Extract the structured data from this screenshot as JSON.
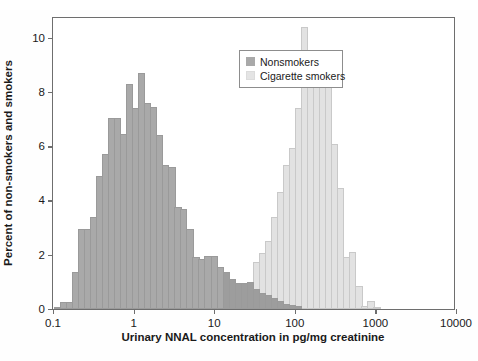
{
  "chart_data": {
    "type": "bar",
    "title": "",
    "subtitle": "",
    "xlabel": "Urinary NNAL concentration in pg/mg creatinine",
    "ylabel": "Percent of non-smokers and smokers",
    "xscale": "log",
    "xlim": [
      0.1,
      10000
    ],
    "ylim": [
      0,
      10.8
    ],
    "xticks": [
      0.1,
      1,
      10,
      100,
      1000,
      10000
    ],
    "xtick_labels": [
      "0.1",
      "1",
      "10",
      "100",
      "1000",
      "10000"
    ],
    "yticks": [
      0,
      2,
      4,
      6,
      8,
      10
    ],
    "ytick_labels": [
      "0",
      "2",
      "4",
      "6",
      "8",
      "10"
    ],
    "grid": false,
    "legend_position": "top-center",
    "bins_per_decade": 11,
    "series": [
      {
        "name": "Nonsmokers",
        "color": "#a9a9a9",
        "bins": [
          {
            "x": 0.115,
            "value": 0.05
          },
          {
            "x": 0.135,
            "value": 0.25
          },
          {
            "x": 0.16,
            "value": 0.25
          },
          {
            "x": 0.19,
            "value": 1.35
          },
          {
            "x": 0.225,
            "value": 2.95
          },
          {
            "x": 0.27,
            "value": 2.95
          },
          {
            "x": 0.32,
            "value": 3.4
          },
          {
            "x": 0.38,
            "value": 4.9
          },
          {
            "x": 0.45,
            "value": 5.7
          },
          {
            "x": 0.53,
            "value": 7.05
          },
          {
            "x": 0.63,
            "value": 7.05
          },
          {
            "x": 0.75,
            "value": 6.45
          },
          {
            "x": 0.89,
            "value": 8.3
          },
          {
            "x": 1.06,
            "value": 7.4
          },
          {
            "x": 1.26,
            "value": 8.7
          },
          {
            "x": 1.5,
            "value": 7.6
          },
          {
            "x": 1.78,
            "value": 7.45
          },
          {
            "x": 2.1,
            "value": 6.4
          },
          {
            "x": 2.5,
            "value": 5.3
          },
          {
            "x": 3.0,
            "value": 5.25
          },
          {
            "x": 3.55,
            "value": 3.75
          },
          {
            "x": 4.2,
            "value": 3.7
          },
          {
            "x": 5.0,
            "value": 2.95
          },
          {
            "x": 5.95,
            "value": 1.9
          },
          {
            "x": 7.05,
            "value": 1.85
          },
          {
            "x": 8.4,
            "value": 1.95
          },
          {
            "x": 10.0,
            "value": 1.95
          },
          {
            "x": 11.9,
            "value": 1.55
          },
          {
            "x": 14.1,
            "value": 1.35
          },
          {
            "x": 16.8,
            "value": 1.1
          },
          {
            "x": 19.9,
            "value": 0.95
          },
          {
            "x": 23.7,
            "value": 0.95
          },
          {
            "x": 28.1,
            "value": 1.0
          },
          {
            "x": 33.4,
            "value": 0.75
          },
          {
            "x": 39.7,
            "value": 0.6
          },
          {
            "x": 47.2,
            "value": 0.5
          },
          {
            "x": 56.0,
            "value": 0.4
          },
          {
            "x": 66.5,
            "value": 0.3
          },
          {
            "x": 79.0,
            "value": 0.2
          },
          {
            "x": 94.0,
            "value": 0.15
          },
          {
            "x": 111.5,
            "value": 0.1
          }
        ]
      },
      {
        "name": "Cigarette smokers",
        "color": "#e2e2e2",
        "bins": [
          {
            "x": 14.1,
            "value": 0.06
          },
          {
            "x": 16.8,
            "value": 0.06
          },
          {
            "x": 19.9,
            "value": 0.1
          },
          {
            "x": 23.7,
            "value": 0.95
          },
          {
            "x": 28.1,
            "value": 1.0
          },
          {
            "x": 33.4,
            "value": 1.75
          },
          {
            "x": 39.7,
            "value": 2.05
          },
          {
            "x": 47.2,
            "value": 2.5
          },
          {
            "x": 56.0,
            "value": 3.4
          },
          {
            "x": 66.5,
            "value": 4.3
          },
          {
            "x": 79.0,
            "value": 5.3
          },
          {
            "x": 94.0,
            "value": 5.95
          },
          {
            "x": 111.5,
            "value": 7.4
          },
          {
            "x": 132.5,
            "value": 10.4
          },
          {
            "x": 157.5,
            "value": 8.8
          },
          {
            "x": 187.0,
            "value": 9.1
          },
          {
            "x": 222.0,
            "value": 8.4
          },
          {
            "x": 264.0,
            "value": 8.55
          },
          {
            "x": 313.0,
            "value": 6.1
          },
          {
            "x": 372.0,
            "value": 4.45
          },
          {
            "x": 442.0,
            "value": 1.9
          },
          {
            "x": 525.0,
            "value": 2.1
          },
          {
            "x": 624.0,
            "value": 0.85
          },
          {
            "x": 741.0,
            "value": 0.1
          },
          {
            "x": 880.0,
            "value": 0.3
          },
          {
            "x": 1046.0,
            "value": 0.06
          }
        ]
      }
    ]
  },
  "legend": {
    "items": [
      {
        "label": "Nonsmokers",
        "color": "#a9a9a9"
      },
      {
        "label": "Cigarette smokers",
        "color": "#e4e4e4"
      }
    ]
  }
}
